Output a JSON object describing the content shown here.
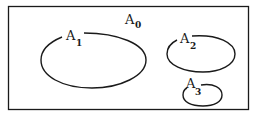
{
  "diagram": {
    "universe": {
      "label": "A",
      "subscript": "0"
    },
    "sets": [
      {
        "label": "A",
        "subscript": "1"
      },
      {
        "label": "A",
        "subscript": "2"
      },
      {
        "label": "A",
        "subscript": "3"
      }
    ],
    "stroke_color": "#1a1a1a",
    "background": "#ffffff"
  }
}
